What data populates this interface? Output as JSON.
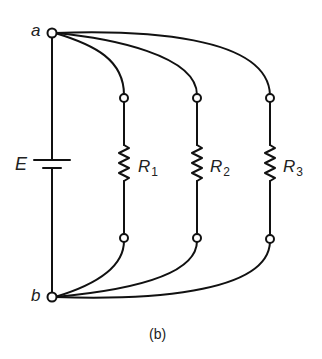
{
  "diagram": {
    "type": "circuit",
    "caption": "(b)",
    "colors": {
      "stroke": "#111111",
      "background": "#ffffff",
      "text": "#222222"
    },
    "nodes": {
      "a": {
        "label": "a"
      },
      "b": {
        "label": "b"
      }
    },
    "source": {
      "label": "E",
      "symbol": "battery"
    },
    "resistors": [
      {
        "name": "R",
        "subscript": "1"
      },
      {
        "name": "R",
        "subscript": "2"
      },
      {
        "name": "R",
        "subscript": "3"
      }
    ],
    "connections": [
      "a - E - b",
      "a - R1 - b",
      "a - R2 - b",
      "a - R3 - b"
    ]
  }
}
